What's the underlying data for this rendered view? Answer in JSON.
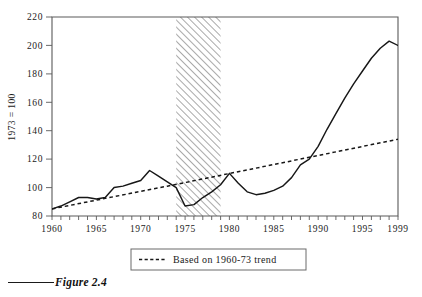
{
  "figure": {
    "caption": "Figure 2.4"
  },
  "legend": {
    "position": "below-axis",
    "entries": [
      {
        "label": "Based on 1960-73 trend",
        "style": "dashed"
      }
    ]
  },
  "chart_data": {
    "type": "line",
    "title": "",
    "subtitle": "",
    "xlabel": "",
    "ylabel": "1973 = 100",
    "xlim": [
      1960,
      1999
    ],
    "ylim": [
      80,
      220
    ],
    "ytick_labels": [
      "80",
      "100",
      "120",
      "140",
      "160",
      "180",
      "200",
      "220"
    ],
    "yticks": [
      80,
      100,
      120,
      140,
      160,
      180,
      200,
      220
    ],
    "xtick_labels": [
      "1960",
      "1965",
      "1970",
      "1975",
      "1980",
      "1985",
      "1990",
      "1995",
      "1999"
    ],
    "xticks": [
      1960,
      1965,
      1970,
      1975,
      1980,
      1985,
      1990,
      1995,
      1999
    ],
    "minor_xtick_interval": 1,
    "grid": false,
    "annotations": [
      {
        "type": "shaded-band",
        "name": "hatched-period",
        "x_start": 1974,
        "x_end": 1979,
        "hatch": "diagonal"
      }
    ],
    "series": [
      {
        "name": "Index",
        "style": "solid",
        "x": [
          1960,
          1961,
          1962,
          1963,
          1964,
          1965,
          1966,
          1967,
          1968,
          1969,
          1970,
          1971,
          1972,
          1973,
          1974,
          1975,
          1976,
          1977,
          1978,
          1979,
          1980,
          1981,
          1982,
          1983,
          1984,
          1985,
          1986,
          1987,
          1988,
          1989,
          1990,
          1991,
          1992,
          1993,
          1994,
          1995,
          1996,
          1997,
          1998,
          1999
        ],
        "values": [
          85,
          87,
          90,
          93,
          93,
          92,
          93,
          100,
          101,
          103,
          105,
          112,
          108,
          104,
          100,
          87,
          88,
          93,
          97,
          102,
          110,
          103,
          97,
          95,
          96,
          98,
          101,
          107,
          116,
          120,
          129,
          141,
          152,
          163,
          173,
          182,
          191,
          198,
          203,
          200
        ]
      },
      {
        "name": "Based on 1960-73 trend",
        "style": "dashed",
        "x": [
          1960,
          1973,
          1999
        ],
        "values": [
          85,
          101,
          134
        ]
      }
    ]
  }
}
